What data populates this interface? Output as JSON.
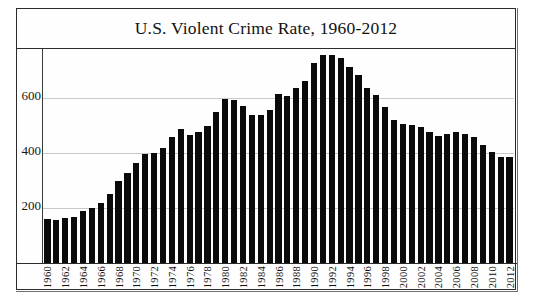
{
  "figure": {
    "title": "U.S. Violent Crime Rate, 1960-2012"
  },
  "chart_data": {
    "type": "bar",
    "title": "U.S. Violent Crime Rate, 1960-2012",
    "subtitle": "",
    "xlabel": "",
    "ylabel": "",
    "ylim": [
      0,
      780
    ],
    "yticks": [
      200,
      400,
      600
    ],
    "ytick_labels": [
      "200",
      "400",
      "600"
    ],
    "grid": true,
    "legend": null,
    "bar_color": "#0b0b0b",
    "gridline_color": "#c9c9c9",
    "axis_color": "#2b2b2b",
    "xtick_step_years": 2,
    "xtick_labels": [
      "1960",
      "1962",
      "1964",
      "1966",
      "1968",
      "1970",
      "1972",
      "1974",
      "1976",
      "1978",
      "1980",
      "1982",
      "1984",
      "1986",
      "1988",
      "1990",
      "1992",
      "1994",
      "1996",
      "1998",
      "2000",
      "2002",
      "2004",
      "2006",
      "2008",
      "2010",
      "2012"
    ],
    "categories": [
      "1960",
      "1961",
      "1962",
      "1963",
      "1964",
      "1965",
      "1966",
      "1967",
      "1968",
      "1969",
      "1970",
      "1971",
      "1972",
      "1973",
      "1974",
      "1975",
      "1976",
      "1977",
      "1978",
      "1979",
      "1980",
      "1981",
      "1982",
      "1983",
      "1984",
      "1985",
      "1986",
      "1987",
      "1988",
      "1989",
      "1990",
      "1991",
      "1992",
      "1993",
      "1994",
      "1995",
      "1996",
      "1997",
      "1998",
      "1999",
      "2000",
      "2001",
      "2002",
      "2003",
      "2004",
      "2005",
      "2006",
      "2007",
      "2008",
      "2009",
      "2010",
      "2011",
      "2012"
    ],
    "values": [
      160.9,
      158.1,
      162.3,
      168.2,
      190.6,
      200.2,
      220.0,
      253.2,
      298.4,
      328.7,
      363.5,
      396.0,
      401.0,
      417.4,
      461.1,
      487.8,
      467.8,
      475.9,
      497.8,
      548.9,
      596.6,
      594.3,
      571.1,
      537.7,
      539.2,
      556.6,
      617.7,
      609.7,
      637.2,
      663.1,
      729.6,
      758.2,
      757.7,
      747.1,
      713.6,
      684.5,
      636.6,
      611.0,
      567.6,
      523.0,
      506.5,
      504.5,
      494.4,
      475.8,
      463.2,
      469.0,
      479.3,
      471.8,
      458.6,
      431.9,
      404.5,
      387.1,
      386.9
    ]
  }
}
